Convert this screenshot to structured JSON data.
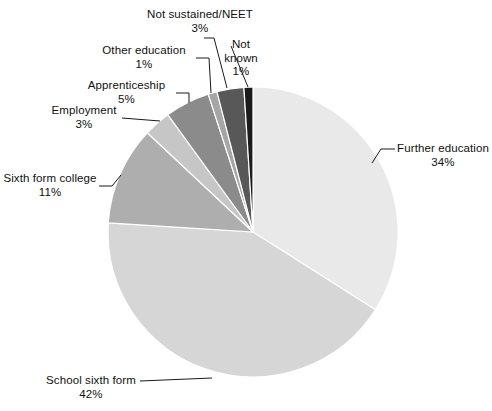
{
  "chart_data": {
    "type": "pie",
    "title": "",
    "subtitle": "",
    "xlabel": "",
    "ylabel": "",
    "legend_position": "none",
    "grid": false,
    "units": "percent",
    "total": 100,
    "start_angle_deg": 0,
    "direction": "clockwise",
    "categories": [
      "Further education",
      "School sixth form",
      "Sixth form college",
      "Employment",
      "Apprenticeship",
      "Other education",
      "Not sustained/NEET",
      "Not known"
    ],
    "values": [
      34,
      42,
      11,
      3,
      5,
      1,
      3,
      1
    ],
    "value_labels": [
      "34%",
      "42%",
      "11%",
      "3%",
      "5%",
      "1%",
      "3%",
      "1%"
    ],
    "colors": [
      "#e9e9e9",
      "#d6d6d6",
      "#aeaeae",
      "#c6c6c6",
      "#8b8b8b",
      "#a6a6a6",
      "#585858",
      "#1c1c1c"
    ],
    "slices": [
      {
        "name": "Further education",
        "value": 34,
        "label": "Further education",
        "percent_label": "34%",
        "color": "#e9e9e9"
      },
      {
        "name": "School sixth form",
        "value": 42,
        "label": "School sixth form",
        "percent_label": "42%",
        "color": "#d6d6d6"
      },
      {
        "name": "Sixth form college",
        "value": 11,
        "label": "Sixth form college",
        "percent_label": "11%",
        "color": "#aeaeae"
      },
      {
        "name": "Employment",
        "value": 3,
        "label": "Employment",
        "percent_label": "3%",
        "color": "#c6c6c6"
      },
      {
        "name": "Apprenticeship",
        "value": 5,
        "label": "Apprenticeship",
        "percent_label": "5%",
        "color": "#8b8b8b"
      },
      {
        "name": "Other education",
        "value": 1,
        "label": "Other education",
        "percent_label": "1%",
        "color": "#a6a6a6"
      },
      {
        "name": "Not sustained/NEET",
        "value": 3,
        "label": "Not sustained/NEET",
        "percent_label": "3%",
        "color": "#585858"
      },
      {
        "name": "Not known",
        "value": 1,
        "label": "Not known",
        "percent_label": "1%",
        "color": "#1c1c1c"
      }
    ]
  },
  "labels": {
    "further_education": {
      "name": "Further education",
      "percent": "34%"
    },
    "school_sixth_form": {
      "name": "School sixth form",
      "percent": "42%"
    },
    "sixth_form_college": {
      "name": "Sixth form college",
      "percent": "11%"
    },
    "employment": {
      "name": "Employment",
      "percent": "3%"
    },
    "apprenticeship": {
      "name": "Apprenticeship",
      "percent": "5%"
    },
    "other_education": {
      "name": "Other education",
      "percent": "1%"
    },
    "not_sustained_neet": {
      "name": "Not sustained/NEET",
      "percent": "3%"
    },
    "not_known": {
      "name_line1": "Not",
      "name_line2": "known",
      "percent": "1%"
    }
  },
  "style": {
    "slice_separator_color": "#ffffff",
    "leader_line_color": "#1a1a1a",
    "background": "#ffffff"
  }
}
